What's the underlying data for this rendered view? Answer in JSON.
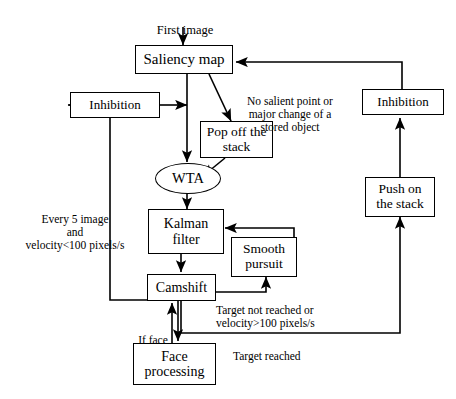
{
  "diagram": {
    "nodes": [
      {
        "id": "saliency_map",
        "label": "Saliency map",
        "shape": "rect"
      },
      {
        "id": "inhibition_left",
        "label": "Inhibition",
        "shape": "rect"
      },
      {
        "id": "inhibition_right",
        "label": "Inhibition",
        "shape": "rect"
      },
      {
        "id": "pop_off_stack",
        "label": "Pop off the\nstack",
        "shape": "rect"
      },
      {
        "id": "wta",
        "label": "WTA",
        "shape": "ellipse"
      },
      {
        "id": "kalman_filter",
        "label": "Kalman\nfilter",
        "shape": "rect"
      },
      {
        "id": "smooth_pursuit",
        "label": "Smooth\npursuit",
        "shape": "rect"
      },
      {
        "id": "camshift",
        "label": "Camshift",
        "shape": "rect"
      },
      {
        "id": "face_processing",
        "label": "Face\nprocessing",
        "shape": "rect"
      },
      {
        "id": "push_on_stack",
        "label": "Push on\nthe stack",
        "shape": "rect"
      }
    ],
    "edge_labels": [
      {
        "id": "first_image",
        "text": "First image"
      },
      {
        "id": "no_salient_point",
        "text": "No salient point or\nmajor change of a\nstored object"
      },
      {
        "id": "every_5_image",
        "text": "Every 5 image\nand\nvelocity<100 pixels/s"
      },
      {
        "id": "target_not_reached",
        "text": "Target not reached or\nvelocity>100 pixels/s"
      },
      {
        "id": "if_face",
        "text": "If face"
      },
      {
        "id": "target_reached",
        "text": "Target reached"
      }
    ],
    "colors": {
      "stroke": "#000000",
      "background": "#ffffff",
      "text": "#000000"
    }
  }
}
